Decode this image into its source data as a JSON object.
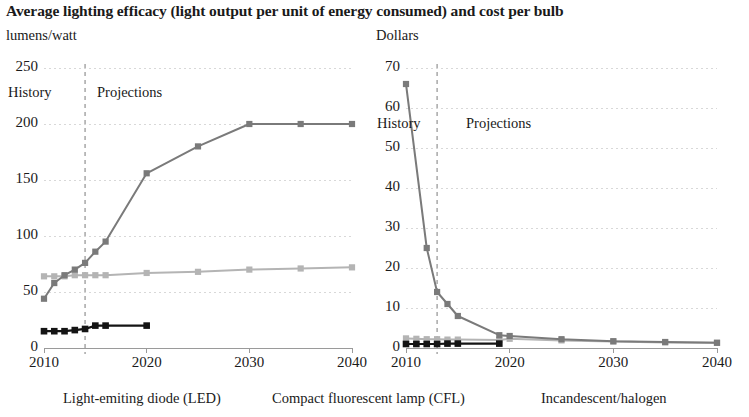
{
  "title": "Average lighting efficacy (light output per unit of energy consumed) and cost per bulb",
  "colors": {
    "led": "#7a7a7a",
    "cfl": "#b4b4b4",
    "incandescent": "#141414",
    "grid": "#d8d8d8",
    "divider": "#9a9a9a",
    "axis": "#9a9a9a",
    "text": "#1a1a1a"
  },
  "legend": {
    "led": "Light-emiting diode (LED)",
    "cfl": "Compact fluorescent lamp (CFL)",
    "incandescent": "Incandescent/halogen"
  },
  "era": {
    "history": "History",
    "projections": "Projections"
  },
  "left_panel": {
    "unit": "lumens/watt",
    "yticks": [
      "250",
      "200",
      "150",
      "100",
      "50",
      "0"
    ],
    "xticks": [
      "2010",
      "2020",
      "2030",
      "2040"
    ],
    "divider_year": 2014
  },
  "right_panel": {
    "unit": "Dollars",
    "yticks": [
      "70",
      "60",
      "50",
      "40",
      "30",
      "20",
      "10",
      "0"
    ],
    "xticks": [
      "2010",
      "2020",
      "2030",
      "2040"
    ],
    "divider_year": 2013
  },
  "chart_data": [
    {
      "type": "line",
      "title": "Average lighting efficacy",
      "subtitle": "",
      "xlabel": "",
      "ylabel": "lumens/watt",
      "xlim": [
        2010,
        2040
      ],
      "ylim": [
        0,
        250
      ],
      "xticks": [
        2010,
        2020,
        2030,
        2040
      ],
      "yticks": [
        0,
        50,
        100,
        150,
        200,
        250
      ],
      "grid": true,
      "legend_position": "below-figure",
      "annotations": [
        {
          "text": "History",
          "x": 2011.5,
          "y": 228
        },
        {
          "text": "Projections",
          "x": 2015.5,
          "y": 228
        },
        {
          "text": "divider",
          "x": 2014,
          "y": null
        }
      ],
      "series": [
        {
          "name": "Light-emiting diode (LED)",
          "color": "#7a7a7a",
          "x": [
            2010,
            2011,
            2012,
            2013,
            2014,
            2015,
            2016,
            2020,
            2025,
            2030,
            2035,
            2040
          ],
          "values": [
            44,
            58,
            65,
            70,
            76,
            86,
            95,
            156,
            180,
            200,
            200,
            200
          ]
        },
        {
          "name": "Compact fluorescent lamp (CFL)",
          "color": "#b4b4b4",
          "x": [
            2010,
            2011,
            2012,
            2013,
            2014,
            2015,
            2016,
            2020,
            2025,
            2030,
            2035,
            2040
          ],
          "values": [
            64,
            64,
            64,
            65,
            65,
            65,
            65,
            67,
            68,
            70,
            71,
            72
          ]
        },
        {
          "name": "Incandescent/halogen",
          "color": "#141414",
          "x": [
            2010,
            2011,
            2012,
            2013,
            2014,
            2015,
            2016,
            2020
          ],
          "values": [
            15,
            15,
            15,
            16,
            17,
            20,
            20,
            20
          ]
        }
      ]
    },
    {
      "type": "line",
      "title": "Cost per bulb",
      "subtitle": "",
      "xlabel": "",
      "ylabel": "Dollars",
      "xlim": [
        2010,
        2040
      ],
      "ylim": [
        0,
        70
      ],
      "xticks": [
        2010,
        2020,
        2030,
        2040
      ],
      "yticks": [
        0,
        10,
        20,
        30,
        40,
        50,
        60,
        70
      ],
      "grid": true,
      "legend_position": "below-figure",
      "annotations": [
        {
          "text": "History",
          "x": 2011.2,
          "y": 53
        },
        {
          "text": "Projections",
          "x": 2014.5,
          "y": 53
        },
        {
          "text": "divider",
          "x": 2013,
          "y": null
        }
      ],
      "series": [
        {
          "name": "Light-emiting diode (LED)",
          "color": "#7a7a7a",
          "x": [
            2010,
            2012,
            2013,
            2014,
            2015,
            2019,
            2020,
            2025,
            2030,
            2035,
            2040
          ],
          "values": [
            66,
            25,
            14,
            11,
            8,
            3.2,
            3.0,
            2.2,
            1.7,
            1.5,
            1.3
          ]
        },
        {
          "name": "Compact fluorescent lamp (CFL)",
          "color": "#b4b4b4",
          "x": [
            2010,
            2011,
            2012,
            2013,
            2014,
            2015,
            2019,
            2020,
            2025,
            2030,
            2035,
            2040
          ],
          "values": [
            2.4,
            2.3,
            2.2,
            2.2,
            2.1,
            2.1,
            2.0,
            2.3,
            1.9,
            1.6,
            1.4,
            1.3
          ]
        },
        {
          "name": "Incandescent/halogen",
          "color": "#141414",
          "x": [
            2010,
            2011,
            2012,
            2013,
            2014,
            2015,
            2019
          ],
          "values": [
            1.0,
            1.0,
            1.0,
            1.0,
            1.1,
            1.1,
            1.1
          ]
        }
      ]
    }
  ]
}
